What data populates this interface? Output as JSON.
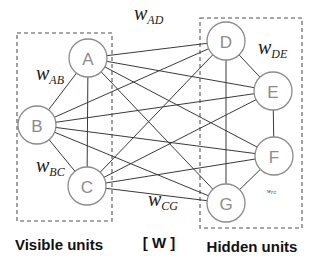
{
  "diagram": {
    "type": "boltzmann-machine",
    "nodes": [
      {
        "id": "A",
        "label": "A",
        "group": "visible",
        "x": 88,
        "y": 58
      },
      {
        "id": "B",
        "label": "B",
        "group": "visible",
        "x": 37,
        "y": 125
      },
      {
        "id": "C",
        "label": "C",
        "group": "visible",
        "x": 87,
        "y": 186
      },
      {
        "id": "D",
        "label": "D",
        "group": "hidden",
        "x": 226,
        "y": 41
      },
      {
        "id": "E",
        "label": "E",
        "group": "hidden",
        "x": 273,
        "y": 91
      },
      {
        "id": "F",
        "label": "F",
        "group": "hidden",
        "x": 274,
        "y": 156
      },
      {
        "id": "G",
        "label": "G",
        "group": "hidden",
        "x": 226,
        "y": 203
      }
    ],
    "edges": [
      [
        "A",
        "B"
      ],
      [
        "B",
        "C"
      ],
      [
        "A",
        "C"
      ],
      [
        "D",
        "E"
      ],
      [
        "E",
        "F"
      ],
      [
        "F",
        "G"
      ],
      [
        "D",
        "G"
      ],
      [
        "A",
        "D"
      ],
      [
        "A",
        "E"
      ],
      [
        "A",
        "F"
      ],
      [
        "A",
        "G"
      ],
      [
        "B",
        "D"
      ],
      [
        "B",
        "E"
      ],
      [
        "B",
        "F"
      ],
      [
        "B",
        "G"
      ],
      [
        "C",
        "D"
      ],
      [
        "C",
        "E"
      ],
      [
        "C",
        "F"
      ],
      [
        "C",
        "G"
      ]
    ],
    "weight_labels": [
      {
        "main": "w",
        "sub": "AD",
        "x": 134,
        "y": 20
      },
      {
        "main": "w",
        "sub": "AB",
        "x": 36,
        "y": 80
      },
      {
        "main": "w",
        "sub": "DE",
        "x": 258,
        "y": 54
      },
      {
        "main": "w",
        "sub": "BC",
        "x": 36,
        "y": 172
      },
      {
        "main": "w",
        "sub": "CG",
        "x": 148,
        "y": 206
      },
      {
        "main": "w",
        "sub": "FG",
        "x": 267,
        "y": 193,
        "small": true
      }
    ],
    "groups": {
      "visible": {
        "label": "Visible units",
        "box": [
          17,
          33,
          95,
          188
        ]
      },
      "hidden": {
        "label": "Hidden units",
        "box": [
          200,
          18,
          102,
          210
        ]
      }
    },
    "matrix_label": "[ W ]"
  }
}
